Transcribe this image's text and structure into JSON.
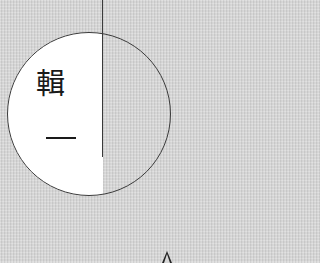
{
  "figure": {
    "circle_text_top": "輯",
    "circle_text_bottom": "一",
    "background_color": "#d6d6d6",
    "fill_color": "#ffffff",
    "stroke_color": "#3a3a3a"
  },
  "icons": {
    "bottom_right": "arrow-up-icon"
  }
}
